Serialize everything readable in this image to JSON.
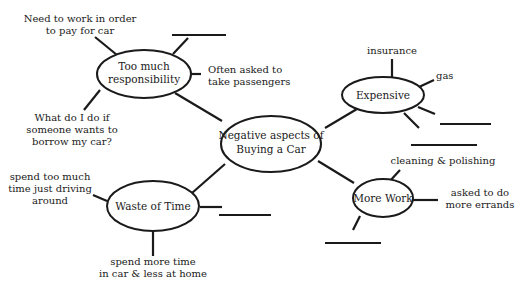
{
  "diagram": {
    "type": "mind-map",
    "center": {
      "lines": [
        "Negative aspects of",
        "Buying a Car"
      ]
    },
    "branches": [
      {
        "id": "responsibility",
        "lines": [
          "Too much",
          "responsibility"
        ],
        "details": [
          {
            "lines": [
              "Need to work in order",
              "to pay for car"
            ]
          },
          {
            "lines": [
              "Often asked to",
              "take passengers"
            ]
          },
          {
            "lines": [
              "What do I do if",
              "someone wants to",
              "borrow my car?"
            ]
          },
          {
            "lines": [],
            "blank": true
          }
        ]
      },
      {
        "id": "expensive",
        "lines": [
          "Expensive"
        ],
        "details": [
          {
            "lines": [
              "insurance"
            ]
          },
          {
            "lines": [
              "gas"
            ]
          },
          {
            "lines": [],
            "blank": true
          },
          {
            "lines": [],
            "blank": true
          }
        ]
      },
      {
        "id": "waste-of-time",
        "lines": [
          "Waste of Time"
        ],
        "details": [
          {
            "lines": [
              "spend too much",
              "time just driving",
              "around"
            ]
          },
          {
            "lines": [
              "spend more time",
              "in car & less at home"
            ]
          },
          {
            "lines": [],
            "blank": true
          }
        ]
      },
      {
        "id": "more-work",
        "lines": [
          "More Work"
        ],
        "details": [
          {
            "lines": [
              "cleaning & polishing"
            ]
          },
          {
            "lines": [
              "asked to do",
              "more errands"
            ]
          },
          {
            "lines": [],
            "blank": true
          }
        ]
      }
    ]
  }
}
